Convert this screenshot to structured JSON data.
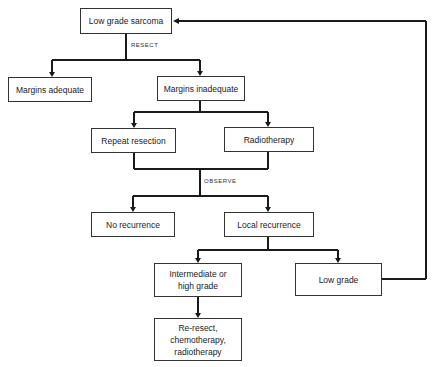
{
  "nodes": {
    "low_grade_sarcoma": "Low grade sarcoma",
    "margins_adequate": "Margins adequate",
    "margins_inadequate": "Margins inadequate",
    "repeat_resection": "Repeat resection",
    "radiotherapy": "Radiotherapy",
    "no_recurrence": "No recurrence",
    "local_recurrence": "Local recurrence",
    "intermediate_high_grade": "Intermediate or high grade",
    "low_grade": "Low grade",
    "re_resect": "Re-resect, chemotherapy, radiotherapy"
  },
  "edge_labels": {
    "resect": "RESECT",
    "observe": "OBSERVE"
  },
  "colors": {
    "line": "#1a1a1a",
    "box_border": "#333333",
    "background": "#ffffff"
  }
}
